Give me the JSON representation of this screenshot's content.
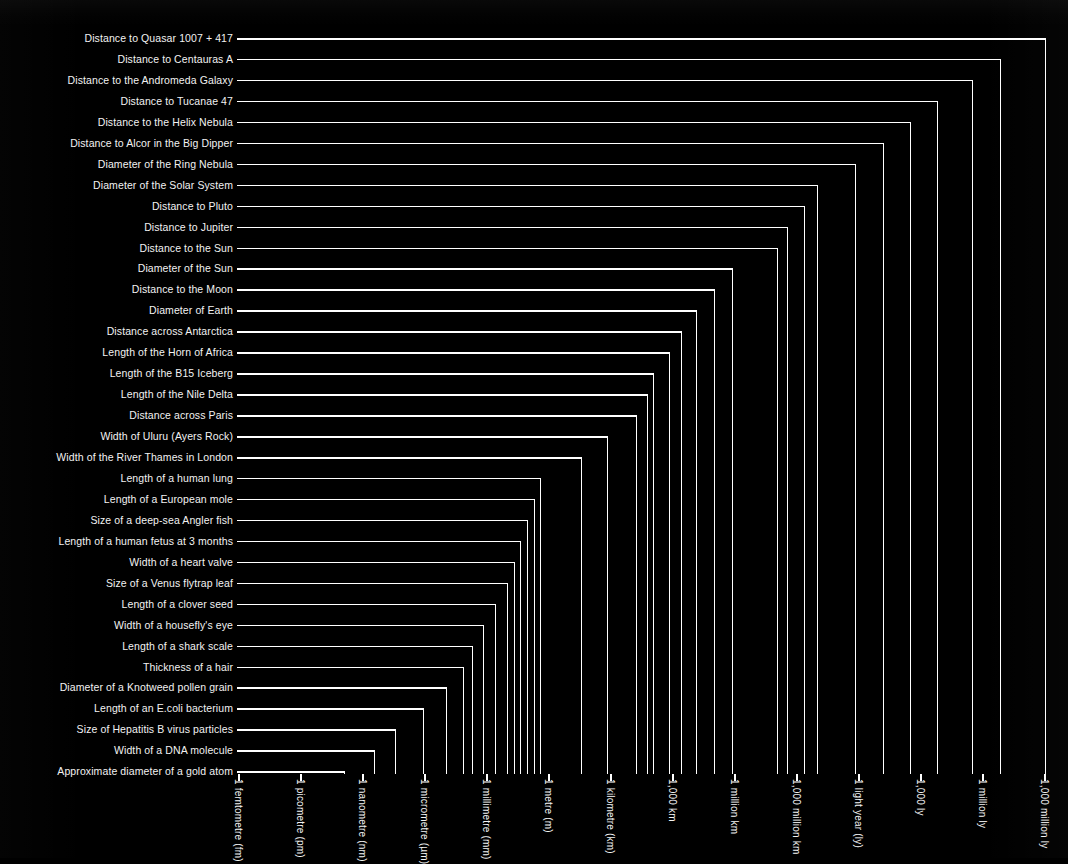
{
  "chart_data": {
    "type": "bar",
    "title": "",
    "subtitle": "",
    "xlabel": "",
    "ylabel": "",
    "orientation": "horizontal",
    "scale": "logarithmic",
    "grid": false,
    "legend": null,
    "axis_ticks": [
      "1 femtometre (fm)",
      "1 picometre (pm)",
      "1 nanometre (nm)",
      "1 micrometre (µm)",
      "1 millimetre (mm)",
      "1 metre (m)",
      "1 kilometre (km)",
      "1,000 km",
      "1 million km",
      "1,000 million km",
      "1 light year (ly)",
      "1,000 ly",
      "1 million ly",
      "1,000 million ly"
    ],
    "tick_exponents_m": [
      -15,
      -12,
      -9,
      -6,
      -3,
      0,
      3,
      6,
      9,
      12,
      15.976,
      18.976,
      21.976,
      24.976
    ],
    "categories": [
      "Distance to Quasar 1007 + 417",
      "Distance to Centauras A",
      "Distance to the Andromeda Galaxy",
      "Distance to Tucanae 47",
      "Distance to the Helix Nebula",
      "Distance to Alcor in the Big Dipper",
      "Diameter of the Ring Nebula",
      "Diameter of the Solar System",
      "Distance to Pluto",
      "Distance to Jupiter",
      "Distance to the Sun",
      "Diameter of the Sun",
      "Distance to the Moon",
      "Diameter of Earth",
      "Distance across Antarctica",
      "Length of the Horn of Africa",
      "Length of the B15 Iceberg",
      "Length of the Nile Delta",
      "Distance across Paris",
      "Width of Uluru (Ayers Rock)",
      "Width of the River Thames in London",
      "Length of a human lung",
      "Length of a European mole",
      "Size of a deep-sea Angler fish",
      "Length of a human fetus at 3 months",
      "Width of a heart valve",
      "Size of a Venus flytrap leaf",
      "Length of a clover seed",
      "Width of a housefly's eye",
      "Length of a shark scale",
      "Thickness of a hair",
      "Diameter of a Knotweed pollen grain",
      "Length of an E.coli bacterium",
      "Size of Hepatitis B virus particles",
      "Width of a DNA molecule",
      "Approximate diameter of a gold atom"
    ],
    "values_px": [
      1046,
      1001,
      973,
      938,
      911,
      884,
      856,
      818,
      805,
      788,
      778,
      733,
      715,
      697,
      682,
      670,
      654,
      648,
      637,
      608,
      582,
      541,
      535,
      528,
      521,
      515,
      508,
      496,
      484,
      473,
      464,
      447,
      424,
      396,
      375,
      345
    ],
    "values_m_log10": [
      25.0,
      22.8,
      21.4,
      19.7,
      18.4,
      17.1,
      15.7,
      13.9,
      13.2,
      12.4,
      11.9,
      9.7,
      8.8,
      7.9,
      7.2,
      6.6,
      5.8,
      5.5,
      5.0,
      3.6,
      2.3,
      0.3,
      0.0,
      -0.3,
      -0.7,
      -1.0,
      -1.3,
      -1.9,
      -2.5,
      -3.0,
      -3.5,
      -4.3,
      -5.4,
      -6.8,
      -7.8,
      -9.2
    ]
  },
  "plot": {
    "x_left_px": 238,
    "tick_spacing_px": 62.0,
    "axis_baseline_y": 774,
    "first_row_y": 38,
    "row_spacing_px": 20.95,
    "label_right_px": 233,
    "line_color": "#ffffff",
    "background_color": "#000000",
    "text_color": "#f2f2f2"
  }
}
